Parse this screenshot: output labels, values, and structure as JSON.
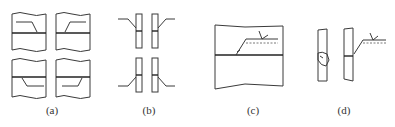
{
  "figure": {
    "panels": [
      {
        "id": "a",
        "label": "(a)",
        "label_x": 52,
        "description": "Four plate butt-joint views with weld arrow and reference line"
      },
      {
        "id": "b",
        "label": "(b)",
        "label_x": 149,
        "description": "Four vertical plate pairs with leader lines at joint"
      },
      {
        "id": "c",
        "label": "(c)",
        "label_x": 253,
        "description": "Plate butt joint with weld symbol reference line and dashed identification line"
      },
      {
        "id": "d",
        "label": "(d)",
        "label_x": 344,
        "description": "Vertical plates, one with weld bead, other with weld symbol"
      }
    ],
    "colors": {
      "line": "#3a3a3a",
      "background": "#ffffff"
    }
  }
}
